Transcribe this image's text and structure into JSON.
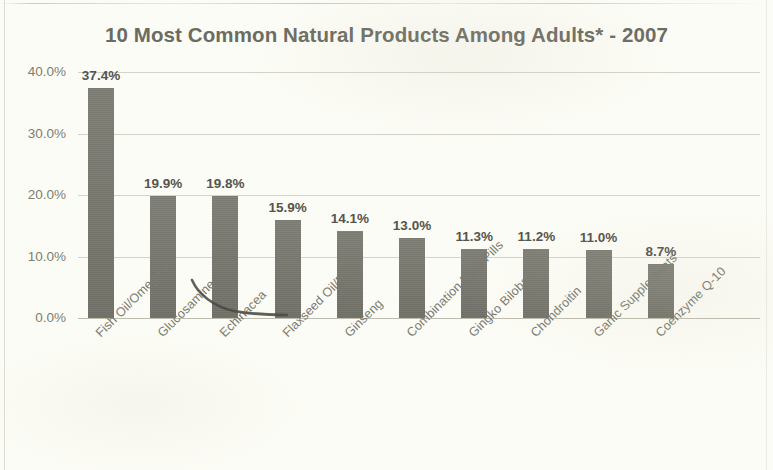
{
  "chart_data": {
    "type": "bar",
    "title": "10 Most Common Natural Products Among Adults* - 2007",
    "xlabel": "",
    "ylabel": "",
    "ylim": [
      0,
      40
    ],
    "ytick_labels": [
      "40.0%",
      "30.0%",
      "20.0%",
      "10.0%",
      "0.0%"
    ],
    "ytick_values": [
      40,
      30,
      20,
      10,
      0
    ],
    "grid": "horizontal",
    "legend": "none",
    "value_suffix": "%",
    "categories": [
      "Fish Oil/Omega 3",
      "Glucosamine",
      "Echinacea",
      "Flaxseed Oil/Pills",
      "Ginseng",
      "Combination Herb Pills",
      "Gingko Biloba",
      "Chondroitin",
      "Garlic Supplements",
      "Coenzyme Q-10"
    ],
    "values": [
      37.4,
      19.9,
      19.8,
      15.9,
      14.1,
      13.0,
      11.3,
      11.2,
      11.0,
      8.7
    ],
    "value_labels": [
      "37.4%",
      "19.9%",
      "19.8%",
      "15.9%",
      "14.1%",
      "13.0%",
      "11.3%",
      "11.2%",
      "11.0%",
      "8.7%"
    ],
    "colors": {
      "bar": "#77776d",
      "background": "#fcfcf6",
      "gridline": "#b2b0a0",
      "title_text": "#6b6b62",
      "tick_text": "#7d7c71",
      "value_text": "#55544d"
    }
  },
  "artifacts": {
    "scan_streak_top": "horizontal-scan-streak",
    "scan_curve": "dark-curved-hair-mark"
  }
}
